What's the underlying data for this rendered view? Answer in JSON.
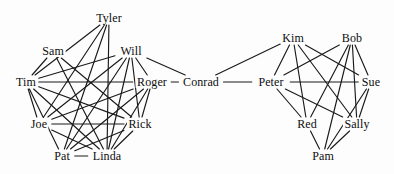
{
  "diagram": {
    "type": "node-link-graph",
    "width": 394,
    "height": 174,
    "background_color": "#fdfdfd",
    "edge_color": "#1a1a1a",
    "label_color": "#0d0d0d",
    "clusters": [
      {
        "name": "left-cluster",
        "bridge_node": "Roger",
        "members": [
          "Tyler",
          "Sam",
          "Will",
          "Tim",
          "Roger",
          "Joe",
          "Rick",
          "Pat",
          "Linda"
        ]
      },
      {
        "name": "right-cluster",
        "bridge_node": "Peter",
        "members": [
          "Kim",
          "Bob",
          "Peter",
          "Sue",
          "Red",
          "Sally",
          "Pam"
        ]
      },
      {
        "name": "bridge",
        "bridge_node": "Conrad",
        "members": [
          "Conrad"
        ]
      }
    ],
    "nodes": [
      {
        "id": "tyler",
        "label": "Tyler",
        "x": 109,
        "y": 18
      },
      {
        "id": "sam",
        "label": "Sam",
        "x": 53,
        "y": 51
      },
      {
        "id": "will",
        "label": "Will",
        "x": 131,
        "y": 51
      },
      {
        "id": "tim",
        "label": "Tim",
        "x": 26,
        "y": 82
      },
      {
        "id": "roger",
        "label": "Roger",
        "x": 152,
        "y": 82
      },
      {
        "id": "conrad",
        "label": "Conrad",
        "x": 201,
        "y": 82
      },
      {
        "id": "peter",
        "label": "Peter",
        "x": 271,
        "y": 82
      },
      {
        "id": "kim",
        "label": "Kim",
        "x": 293,
        "y": 38
      },
      {
        "id": "bob",
        "label": "Bob",
        "x": 352,
        "y": 38
      },
      {
        "id": "sue",
        "label": "Sue",
        "x": 371,
        "y": 82
      },
      {
        "id": "joe",
        "label": "Joe",
        "x": 39,
        "y": 124
      },
      {
        "id": "rick",
        "label": "Rick",
        "x": 140,
        "y": 124
      },
      {
        "id": "red",
        "label": "Red",
        "x": 307,
        "y": 124
      },
      {
        "id": "sally",
        "label": "Sally",
        "x": 357,
        "y": 124
      },
      {
        "id": "pat",
        "label": "Pat",
        "x": 62,
        "y": 156
      },
      {
        "id": "linda",
        "label": "Linda",
        "x": 107,
        "y": 156
      },
      {
        "id": "pam",
        "label": "Pam",
        "x": 323,
        "y": 156
      }
    ],
    "edges": [
      {
        "from": "tyler",
        "to": "linda"
      },
      {
        "from": "tyler",
        "to": "tim"
      },
      {
        "from": "tyler",
        "to": "pat"
      },
      {
        "from": "tyler",
        "to": "joe"
      },
      {
        "from": "sam",
        "to": "rick"
      },
      {
        "from": "sam",
        "to": "linda"
      },
      {
        "from": "sam",
        "to": "tim"
      },
      {
        "from": "will",
        "to": "tim"
      },
      {
        "from": "will",
        "to": "joe"
      },
      {
        "from": "will",
        "to": "pat"
      },
      {
        "from": "will",
        "to": "linda"
      },
      {
        "from": "will",
        "to": "rick"
      },
      {
        "from": "will",
        "to": "roger"
      },
      {
        "from": "will",
        "to": "conrad"
      },
      {
        "from": "tim",
        "to": "roger"
      },
      {
        "from": "tim",
        "to": "rick"
      },
      {
        "from": "tim",
        "to": "linda"
      },
      {
        "from": "tim",
        "to": "joe"
      },
      {
        "from": "tim",
        "to": "pat"
      },
      {
        "from": "roger",
        "to": "joe"
      },
      {
        "from": "roger",
        "to": "pat"
      },
      {
        "from": "roger",
        "to": "linda"
      },
      {
        "from": "roger",
        "to": "rick"
      },
      {
        "from": "roger",
        "to": "conrad"
      },
      {
        "from": "joe",
        "to": "rick"
      },
      {
        "from": "joe",
        "to": "linda"
      },
      {
        "from": "rick",
        "to": "linda"
      },
      {
        "from": "rick",
        "to": "pat"
      },
      {
        "from": "pat",
        "to": "linda"
      },
      {
        "from": "conrad",
        "to": "peter"
      },
      {
        "from": "conrad",
        "to": "kim"
      },
      {
        "from": "peter",
        "to": "kim"
      },
      {
        "from": "peter",
        "to": "bob"
      },
      {
        "from": "peter",
        "to": "sue"
      },
      {
        "from": "peter",
        "to": "red"
      },
      {
        "from": "peter",
        "to": "sally"
      },
      {
        "from": "kim",
        "to": "red"
      },
      {
        "from": "kim",
        "to": "sue"
      },
      {
        "from": "kim",
        "to": "sally"
      },
      {
        "from": "bob",
        "to": "red"
      },
      {
        "from": "bob",
        "to": "sue"
      },
      {
        "from": "bob",
        "to": "sally"
      },
      {
        "from": "bob",
        "to": "pam"
      },
      {
        "from": "sue",
        "to": "sally"
      },
      {
        "from": "sue",
        "to": "pam"
      },
      {
        "from": "sally",
        "to": "pam"
      },
      {
        "from": "red",
        "to": "pam"
      }
    ]
  }
}
